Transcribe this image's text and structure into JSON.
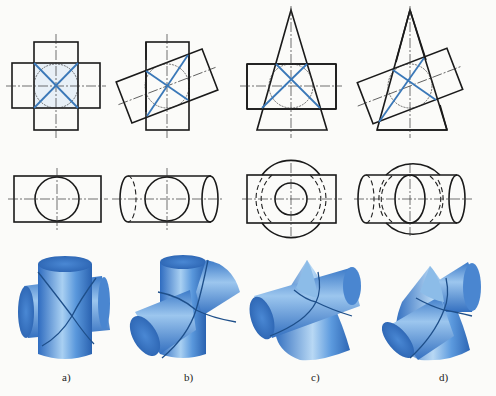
{
  "figure": {
    "colors": {
      "line": "#1a1a1a",
      "intersection_line": "#3a78b8",
      "solid_light": "#9cc6ee",
      "solid_mid": "#4f90d8",
      "solid_dark": "#2a64b4",
      "seam": "#1e4f8a"
    },
    "panels": [
      {
        "id": "a",
        "label": "a)",
        "description": "Two equal-diameter cylinders intersecting at right angles"
      },
      {
        "id": "b",
        "label": "b)",
        "description": "Two equal-diameter cylinders intersecting obliquely"
      },
      {
        "id": "c",
        "label": "c)",
        "description": "Cone and cylinder with common inscribed sphere, axes perpendicular"
      },
      {
        "id": "d",
        "label": "d)",
        "description": "Cone and cylinder with common inscribed sphere, axes oblique"
      }
    ],
    "rows": [
      {
        "name": "front-view",
        "content": "orthographic projection with intersection lines shown as straight blue lines"
      },
      {
        "name": "top-view",
        "content": "orthographic projection with circles and hidden lines"
      },
      {
        "name": "3d-rendering",
        "content": "shaded blue pictorial view"
      }
    ]
  }
}
